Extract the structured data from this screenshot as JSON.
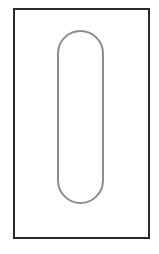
{
  "diagram": {
    "frame": {
      "x": 14,
      "y": 9,
      "width": 135,
      "height": 229,
      "stroke": "#2a2a2a",
      "stroke_width": 2
    },
    "capsule": {
      "x": 58,
      "y": 31,
      "width": 45,
      "height": 172,
      "stroke": "#8c8c8c",
      "stroke_width": 2
    },
    "colors": {
      "background": "#ffffff",
      "frame": "#2a2a2a",
      "capsule": "#8c8c8c"
    }
  }
}
